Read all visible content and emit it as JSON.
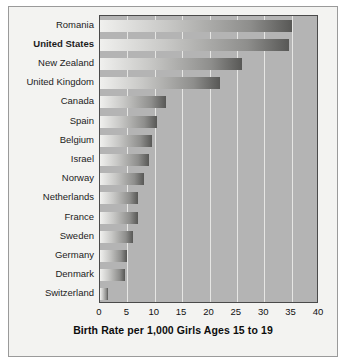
{
  "chart_data": {
    "type": "bar",
    "orientation": "horizontal",
    "title": "",
    "xlabel": "Birth Rate per 1,000 Girls Ages 15 to 19",
    "ylabel": "",
    "xlim": [
      0,
      40
    ],
    "xticks": [
      "0",
      "5",
      "10",
      "15",
      "20",
      "25",
      "30",
      "35",
      "40"
    ],
    "grid": true,
    "legend": "none",
    "highlight_category": "United States",
    "categories": [
      "Romania",
      "United States",
      "New Zealand",
      "United Kingdom",
      "Canada",
      "Spain",
      "Belgium",
      "Israel",
      "Norway",
      "Netherlands",
      "France",
      "Sweden",
      "Germany",
      "Denmark",
      "Switzerland"
    ],
    "values": [
      35,
      34.5,
      26,
      22,
      12,
      10.5,
      9.5,
      9,
      8,
      7,
      7,
      6,
      5,
      4.5,
      1.5
    ]
  }
}
